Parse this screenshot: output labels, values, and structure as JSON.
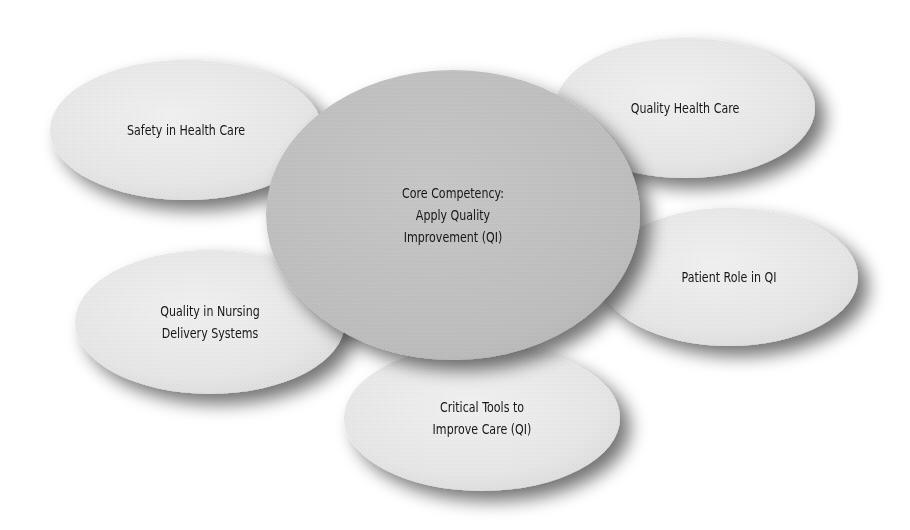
{
  "diagram": {
    "type": "concept-map",
    "center": {
      "id": "core",
      "lines": [
        "Core Competency:",
        "Apply Quality",
        "Improvement (QI)"
      ],
      "cx": 453,
      "cy": 215,
      "rx": 187,
      "ry": 145,
      "fill": "#bfbfbf"
    },
    "satellites": [
      {
        "id": "safety",
        "lines": [
          "Safety in Health Care"
        ],
        "cx": 186,
        "cy": 130,
        "rx": 136,
        "ry": 70,
        "fill": "#e8e8e8"
      },
      {
        "id": "quality-health-care",
        "lines": [
          "Quality Health Care"
        ],
        "cx": 685,
        "cy": 108,
        "rx": 130,
        "ry": 70,
        "fill": "#e8e8e8"
      },
      {
        "id": "patient-role",
        "lines": [
          "Patient Role in QI"
        ],
        "cx": 729,
        "cy": 277,
        "rx": 129,
        "ry": 69,
        "fill": "#e8e8e8"
      },
      {
        "id": "nursing-delivery",
        "lines": [
          "Quality in Nursing",
          "Delivery Systems"
        ],
        "cx": 210,
        "cy": 322,
        "rx": 135,
        "ry": 72,
        "fill": "#e8e8e8"
      },
      {
        "id": "critical-tools",
        "lines": [
          "Critical Tools to",
          "Improve Care (QI)"
        ],
        "cx": 482,
        "cy": 418,
        "rx": 138,
        "ry": 73,
        "fill": "#e8e8e8"
      }
    ],
    "colors": {
      "background": "#ffffff",
      "text": "#161616",
      "shadow": "#6f6f6f"
    }
  }
}
